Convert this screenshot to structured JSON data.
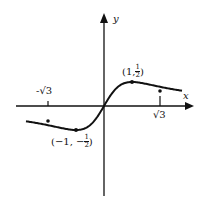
{
  "figure": {
    "function": "y = x/(1+x^2)",
    "axes": {
      "x_label": "x",
      "y_label": "y"
    },
    "ticks": [
      {
        "label": "-√3",
        "x": -1.732
      },
      {
        "label": "√3",
        "x": 1.732
      }
    ],
    "points": [
      {
        "label_left": "(1, ",
        "frac_num": "1",
        "frac_den": "2",
        "label_right": ")",
        "x": 1,
        "y": 0.5
      },
      {
        "label_left": "(−1, −",
        "frac_num": "1",
        "frac_den": "2",
        "label_right": ")",
        "x": -1,
        "y": -0.5
      }
    ],
    "colors": {
      "stroke": "#111111",
      "background": "#ffffff"
    }
  }
}
